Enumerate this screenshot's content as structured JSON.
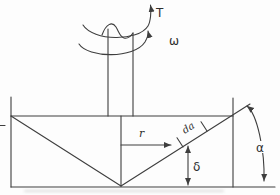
{
  "figure": {
    "type": "rotating-cone-indentation-diagram",
    "labels": {
      "torque": "T",
      "angular_velocity": "ω",
      "radius": "r",
      "differential_element": "da",
      "depth": "δ",
      "apex_angle": "α"
    },
    "colors": {
      "line": "#3e3e3e",
      "text": "#2e2e2e",
      "background": "#fdfdfd"
    }
  }
}
